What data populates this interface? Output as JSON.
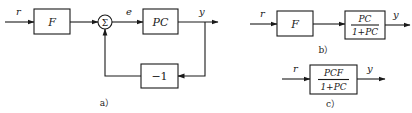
{
  "diagram_a": {
    "input_label": "r",
    "prefilter_block": "F",
    "summer_symbol": "Σ",
    "error_label": "e",
    "plant_block": "PC",
    "output_label": "y",
    "feedback_block": "−1",
    "caption": "a）"
  },
  "diagram_b": {
    "input_label": "r",
    "prefilter_block": "F",
    "closed_loop_block": {
      "numerator": "PC",
      "denominator": "1+PC"
    },
    "output_label": "y",
    "caption": "b）"
  },
  "diagram_c": {
    "input_label": "r",
    "overall_block": {
      "numerator": "PCF",
      "denominator": "1+PC"
    },
    "output_label": "y",
    "caption": "c）"
  },
  "colors": {
    "ink": "#1a1a1a",
    "background": "#ffffff"
  }
}
